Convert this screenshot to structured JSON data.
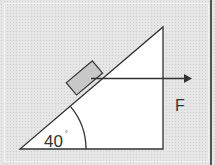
{
  "diagram": {
    "type": "inclined-plane-force",
    "angle_label": "40",
    "angle_unit": "°",
    "force_label": "F",
    "colors": {
      "background": "#e6e6e6",
      "triangle_fill": "#ffffff",
      "line": "#333333",
      "block_fill": "#c8c8c8"
    }
  }
}
